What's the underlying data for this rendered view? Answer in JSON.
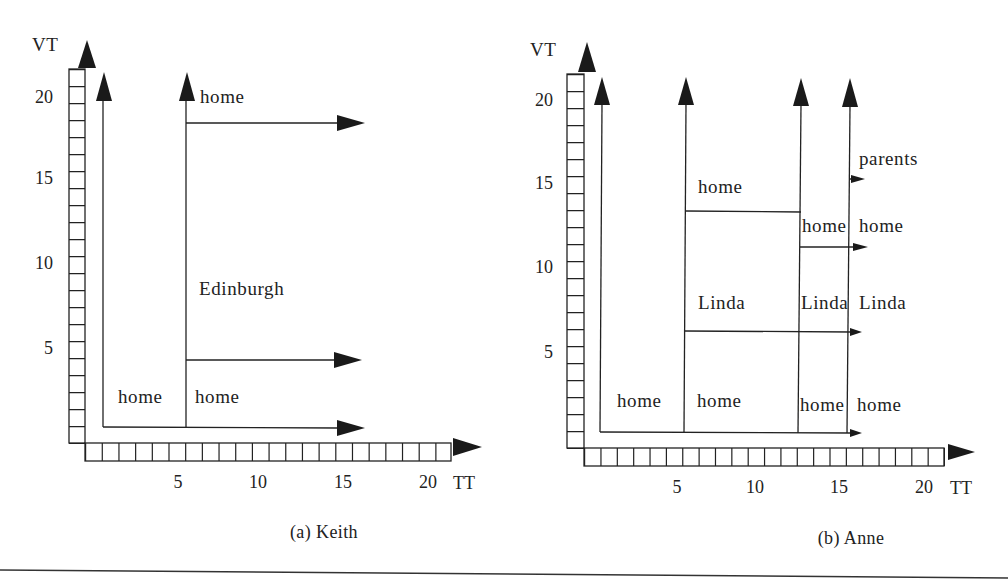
{
  "colors": {
    "ink": "#222222",
    "background": "#ffffff"
  },
  "panels": {
    "keith": {
      "caption": "(a) Keith",
      "y_axis_label": "VT",
      "x_axis_label": "TT",
      "y_ticks": [
        "20",
        "15",
        "10",
        "5"
      ],
      "x_ticks": [
        "5",
        "10",
        "15",
        "20"
      ],
      "labels": {
        "top_right": "home",
        "middle_right": "Edinburgh",
        "bottom_left": "home",
        "bottom_right": "home"
      }
    },
    "anne": {
      "caption": "(b) Anne",
      "y_axis_label": "VT",
      "x_axis_label": "TT",
      "y_ticks": [
        "20",
        "15",
        "10",
        "5"
      ],
      "x_ticks": [
        "5",
        "10",
        "15",
        "20"
      ],
      "labels": {
        "parents": "parents",
        "col2_top": "home",
        "col3_upper": "home",
        "col4_upper": "home",
        "col2_middle": "Linda",
        "col3_middle": "Linda",
        "col4_middle": "Linda",
        "col1_bottom": "home",
        "col2_bottom": "home",
        "col3_bottom": "home",
        "col4_bottom": "home"
      }
    }
  }
}
